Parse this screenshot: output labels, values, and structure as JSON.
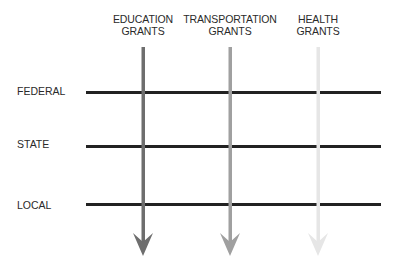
{
  "columns": [
    {
      "line1": "EDUCATION",
      "line2": "GRANTS",
      "x": 143,
      "color": "#6e6e6e"
    },
    {
      "line1": "TRANSPORTATION",
      "line2": "GRANTS",
      "x": 230,
      "color": "#a0a0a0"
    },
    {
      "line1": "HEALTH",
      "line2": "GRANTS",
      "x": 318,
      "color": "#e6e6e6"
    }
  ],
  "rows": [
    {
      "label": "FEDERAL",
      "y": 92
    },
    {
      "label": "STATE",
      "y": 147
    },
    {
      "label": "LOCAL",
      "y": 204
    }
  ],
  "line_color": "#222222"
}
